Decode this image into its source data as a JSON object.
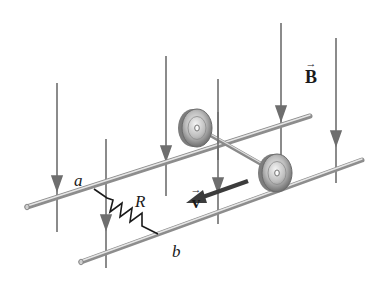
{
  "figure": {
    "labels": {
      "rail_a": "a",
      "rail_b": "b",
      "resistor": "R",
      "field": "B",
      "velocity": "v",
      "vector_arrow": "→"
    },
    "colors": {
      "field_lines": "#6e6e6e",
      "rails": "#a9a9a9",
      "rail_highlight": "#e0e0e0",
      "resistor": "#1a1a1a",
      "velocity_arrow": "#3c3c3c",
      "wheel": "#9a9a9a",
      "background": "#ffffff"
    }
  }
}
